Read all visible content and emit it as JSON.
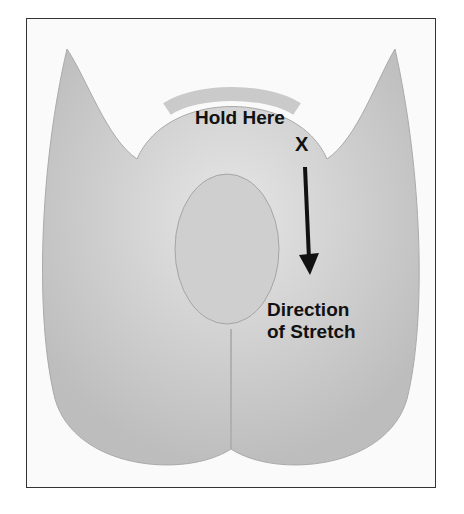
{
  "diagram": {
    "style": "grayscale anatomical illustration (rendered abstractly)",
    "labels": {
      "hold": "Hold Here",
      "marker": "X",
      "stretch_line1": "Direction",
      "stretch_line2": "of Stretch"
    },
    "arrow": {
      "direction": "down",
      "color": "#111111"
    },
    "colors": {
      "border": "#333333",
      "background": "#fafafa",
      "text": "#111111"
    }
  }
}
